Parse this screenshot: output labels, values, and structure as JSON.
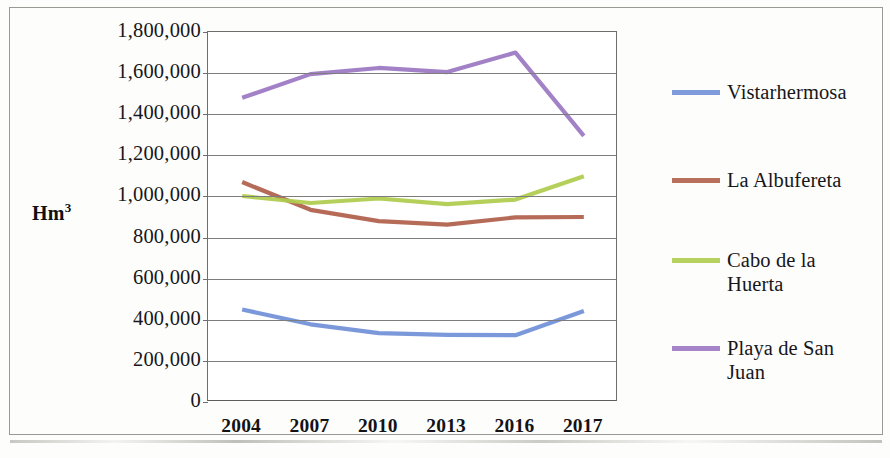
{
  "chart_data": {
    "type": "line",
    "title": "",
    "xlabel": "",
    "ylabel": "Hm³",
    "categories": [
      "2004",
      "2007",
      "2010",
      "2013",
      "2016",
      "2017"
    ],
    "ylim": [
      0,
      1800000
    ],
    "ytick_labels": [
      "1,800,000",
      "1,600,000",
      "1,400,000",
      "1,200,000",
      "1,000,000",
      "800,000",
      "600,000",
      "400,000",
      "200,000",
      "0"
    ],
    "ytick_values": [
      1800000,
      1600000,
      1400000,
      1200000,
      1000000,
      800000,
      600000,
      400000,
      200000,
      0
    ],
    "grid": true,
    "legend_position": "right",
    "series": [
      {
        "name": "Vistarhermosa",
        "color": "#7190d8",
        "values": [
          450000,
          378000,
          335000,
          327000,
          325000,
          443000
        ]
      },
      {
        "name": "La Albufereta",
        "color": "#b0604b",
        "values": [
          1070000,
          935000,
          880000,
          863000,
          898000,
          900000
        ]
      },
      {
        "name": "Cabo de la Huerta",
        "color": "#afcc4d",
        "values": [
          1002000,
          968000,
          990000,
          963000,
          985000,
          1098000
        ]
      },
      {
        "name": "Playa de San Juan",
        "color": "#9b77c3",
        "values": [
          1480000,
          1595000,
          1625000,
          1605000,
          1700000,
          1295000
        ]
      }
    ]
  },
  "legend": {
    "items": [
      {
        "label": "Vistarhermosa",
        "color": "#7190d8"
      },
      {
        "label": "La Albufereta",
        "color": "#b0604b"
      },
      {
        "label": "Cabo de la Huerta",
        "color": "#afcc4d"
      },
      {
        "label": "Playa de San Juan",
        "color": "#9b77c3"
      }
    ]
  },
  "axis": {
    "y_title": "Hm",
    "y_title_sup": "3"
  }
}
